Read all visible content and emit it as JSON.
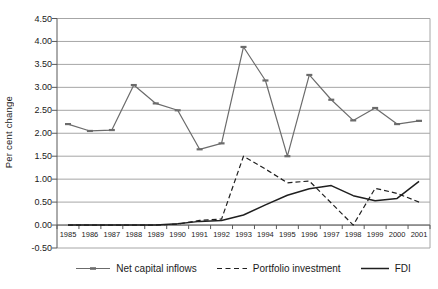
{
  "chart_data": {
    "type": "line",
    "title": "",
    "xlabel": "",
    "ylabel": "Per cent change",
    "ylim": [
      -0.5,
      4.5
    ],
    "grid": "horizontal",
    "legend_position": "bottom",
    "y_ticks": [
      "4.50",
      "4.00",
      "3.50",
      "3.00",
      "2.50",
      "2.00",
      "1.50",
      "1.00",
      "0.50",
      "0.00",
      "-0.50"
    ],
    "categories": [
      "1985",
      "1986",
      "1987",
      "1988",
      "1989",
      "1990",
      "1991",
      "1992",
      "1993",
      "1994",
      "1995",
      "1996",
      "1997",
      "1998",
      "1999",
      "2000",
      "2001"
    ],
    "series": [
      {
        "name": "Net capital inflows",
        "style": "solid",
        "marker": "dash",
        "color": "#6b6b6b",
        "width": 1.2,
        "values": [
          2.2,
          2.05,
          2.07,
          3.05,
          2.65,
          2.5,
          1.65,
          1.78,
          3.88,
          3.15,
          1.5,
          3.27,
          2.73,
          2.28,
          2.55,
          2.2,
          2.27
        ]
      },
      {
        "name": "Portfolio investment",
        "style": "dashed",
        "marker": "none",
        "color": "#1f1f1f",
        "width": 1.2,
        "values": [
          0.0,
          0.0,
          0.0,
          0.0,
          0.0,
          0.02,
          0.1,
          0.13,
          1.5,
          1.22,
          0.92,
          0.96,
          0.48,
          0.0,
          0.8,
          0.69,
          0.5
        ]
      },
      {
        "name": "FDI",
        "style": "solid",
        "marker": "none",
        "color": "#1f1f1f",
        "width": 1.5,
        "values": [
          0.0,
          0.0,
          0.0,
          0.0,
          0.0,
          0.03,
          0.08,
          0.1,
          0.22,
          0.44,
          0.65,
          0.79,
          0.86,
          0.64,
          0.53,
          0.58,
          0.95
        ]
      }
    ],
    "colors": {
      "grid": "#a6a6a6",
      "axis": "#595959",
      "text": "#1a1a1a"
    }
  }
}
